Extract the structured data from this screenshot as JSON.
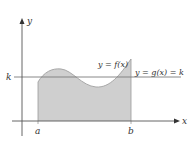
{
  "diagram": {
    "type": "area-under-curve",
    "axes": {
      "x_label": "x",
      "y_label": "y"
    },
    "ticks": {
      "a_label": "a",
      "b_label": "b",
      "k_label": "k"
    },
    "curves": {
      "f_label": "y = f(x)",
      "g_label": "y = g(x) = k"
    },
    "colors": {
      "axis": "#555555",
      "shade": "#cfcfcf",
      "curve": "#9a9a9a",
      "k_line": "#777777"
    }
  }
}
